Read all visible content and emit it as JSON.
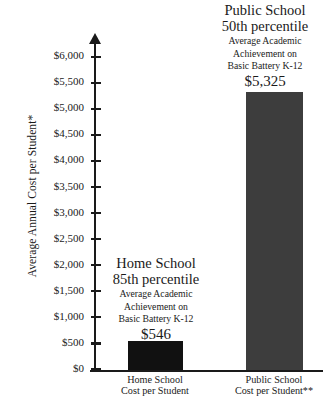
{
  "chart_data": {
    "type": "bar",
    "title": "",
    "xlabel": "",
    "ylabel": "Average Annual Cost per Student*",
    "ylim": [
      0,
      6000
    ],
    "grid": false,
    "legend": "none",
    "categories": [
      "Home School\nCost per Student",
      "Public School\nCost per Student**"
    ],
    "values": [
      546,
      5325
    ],
    "value_labels": [
      "$546",
      "$5,325"
    ],
    "tick_labels": [
      "$6,000",
      "$5,500",
      "$5,000",
      "$4,500",
      "$4,000",
      "$3,500",
      "$3,000",
      "$2,500",
      "$2,000",
      "$1,500",
      "$1,000",
      "$500",
      "$0"
    ],
    "tick_values": [
      6000,
      5500,
      5000,
      4500,
      4000,
      3500,
      3000,
      2500,
      2000,
      1500,
      1000,
      500,
      0
    ],
    "annotations": [
      {
        "for": "Home School",
        "headline_line1": "Home School",
        "headline_line2": "85th percentile",
        "sub_line1": "Average Academic",
        "sub_line2": "Achievement on",
        "sub_line3": "Basic Battery K-12",
        "value": "$546"
      },
      {
        "for": "Public School",
        "headline_line1": "Public School",
        "headline_line2": "50th percentile",
        "sub_line1": "Average Academic",
        "sub_line2": "Achievement on",
        "sub_line3": "Basic Battery K-12",
        "value": "$5,325"
      }
    ],
    "colors": {
      "home_bar": "#111111",
      "public_bar": "#3d3d3d",
      "axis": "#1a1a1a",
      "background": "#ffffff"
    }
  },
  "axis": {
    "y_title": "Average Annual Cost per Student*",
    "ticks": [
      "$6,000",
      "$5,500",
      "$5,000",
      "$4,500",
      "$4,000",
      "$3,500",
      "$3,000",
      "$2,500",
      "$2,000",
      "$1,500",
      "$1,000",
      "$500",
      "$0"
    ]
  },
  "categories": {
    "home": {
      "line1": "Home School",
      "line2": "Cost per Student"
    },
    "public": {
      "line1": "Public School",
      "line2": "Cost per Student**"
    }
  },
  "annotations": {
    "home": {
      "headline1": "Home School",
      "headline2": "85th percentile",
      "sub1": "Average Academic",
      "sub2": "Achievement on",
      "sub3": "Basic Battery K-12",
      "value": "$546"
    },
    "public": {
      "headline1": "Public School",
      "headline2": "50th percentile",
      "sub1": "Average Academic",
      "sub2": "Achievement on",
      "sub3": "Basic Battery K-12",
      "value": "$5,325"
    }
  }
}
